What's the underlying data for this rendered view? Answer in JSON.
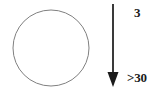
{
  "figure": {
    "background_color": "#ffffff",
    "shapes": {
      "circle": {
        "name": "circle-outline",
        "center_x": 51,
        "center_y": 48,
        "radius": 38,
        "stroke_color": "#808080",
        "stroke_width": 1,
        "fill": "none"
      },
      "arrow": {
        "name": "downward-arrow",
        "x": 113,
        "y_start": 4,
        "y_end": 86,
        "stroke_color": "#3a3a3a",
        "stroke_width": 2,
        "head_color": "#1a1a1a",
        "head_width": 11,
        "head_height": 14,
        "direction": "down"
      }
    },
    "labels": {
      "top": {
        "text": "3",
        "color": "#1a1a1a",
        "bold": true
      },
      "bottom": {
        "text": ">30",
        "color": "#1a1a1a",
        "bold": true
      }
    }
  }
}
